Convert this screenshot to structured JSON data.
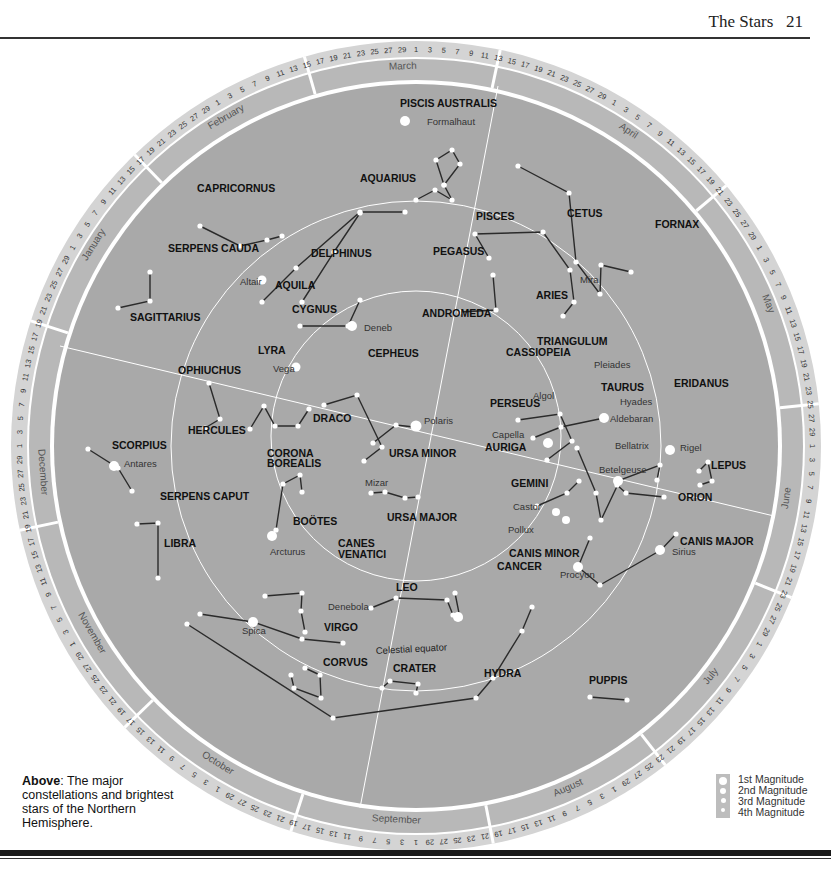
{
  "header": {
    "title": "The Stars",
    "page_number": "21"
  },
  "caption": {
    "lead": "Above",
    "text": ": The major constellations and brightest stars of the Northern Hemisphere."
  },
  "legend": {
    "items": [
      "1st Magnitude",
      "2nd Magnitude",
      "3rd Magnitude",
      "4th Magnitude"
    ]
  },
  "chart": {
    "center": [
      416,
      446
    ],
    "radii": {
      "outer_ring": 405,
      "month_band": 385,
      "disc": 362,
      "equator": 245,
      "inner": 145
    },
    "colors": {
      "disc": "#a9a9a9",
      "band": "#b8b8b8",
      "ring": "#d4d4d4",
      "line": "#2b2b2b",
      "star": "#ffffff",
      "grid": "#ffffff"
    },
    "months": [
      {
        "name": "March",
        "angle": -92
      },
      {
        "name": "February",
        "angle": -120
      },
      {
        "name": "January",
        "angle": -148
      },
      {
        "name": "December",
        "angle": 176
      },
      {
        "name": "November",
        "angle": 150
      },
      {
        "name": "October",
        "angle": 122
      },
      {
        "name": "September",
        "angle": 93
      },
      {
        "name": "August",
        "angle": 66
      },
      {
        "name": "July",
        "angle": 38
      },
      {
        "name": "June",
        "angle": 8
      },
      {
        "name": "May",
        "angle": -22
      },
      {
        "name": "April",
        "angle": -56
      }
    ],
    "month_dividers": [
      -78,
      -106,
      -134,
      -162,
      168,
      136,
      108,
      79,
      52,
      22,
      -6,
      -40
    ],
    "constellations": [
      {
        "name": "PISCIS AUSTRALIS",
        "label_xy": [
          400,
          107
        ]
      },
      {
        "name": "CAPRICORNUS",
        "label_xy": [
          197,
          192
        ]
      },
      {
        "name": "AQUARIUS",
        "label_xy": [
          360,
          182
        ]
      },
      {
        "name": "PISCES",
        "label_xy": [
          476,
          220
        ]
      },
      {
        "name": "CETUS",
        "label_xy": [
          567,
          217
        ]
      },
      {
        "name": "FORNAX",
        "label_xy": [
          655,
          228
        ]
      },
      {
        "name": "SERPENS CAUDA",
        "label_xy": [
          168,
          252
        ]
      },
      {
        "name": "DELPHINUS",
        "label_xy": [
          311,
          257
        ]
      },
      {
        "name": "PEGASUS",
        "label_xy": [
          433,
          255
        ]
      },
      {
        "name": "AQUILA",
        "label_xy": [
          275,
          289
        ]
      },
      {
        "name": "ARIES",
        "label_xy": [
          536,
          299
        ]
      },
      {
        "name": "SAGITTARIUS",
        "label_xy": [
          130,
          321
        ]
      },
      {
        "name": "CYGNUS",
        "label_xy": [
          292,
          313
        ]
      },
      {
        "name": "ANDROMEDA",
        "label_xy": [
          422,
          317
        ]
      },
      {
        "name": "TRIANGULUM",
        "label_xy": [
          537,
          345
        ]
      },
      {
        "name": "LYRA",
        "label_xy": [
          258,
          354
        ]
      },
      {
        "name": "CEPHEUS",
        "label_xy": [
          368,
          357
        ]
      },
      {
        "name": "CASSIOPEIA",
        "label_xy": [
          506,
          356
        ]
      },
      {
        "name": "OPHIUCHUS",
        "label_xy": [
          178,
          374
        ]
      },
      {
        "name": "ERIDANUS",
        "label_xy": [
          674,
          387
        ]
      },
      {
        "name": "TAURUS",
        "label_xy": [
          601,
          391
        ]
      },
      {
        "name": "PERSEUS",
        "label_xy": [
          490,
          407
        ]
      },
      {
        "name": "DRACO",
        "label_xy": [
          313,
          422
        ]
      },
      {
        "name": "HERCULES",
        "label_xy": [
          188,
          434
        ]
      },
      {
        "name": "URSA MINOR",
        "label_xy": [
          389,
          457
        ]
      },
      {
        "name": "AURIGA",
        "label_xy": [
          485,
          451
        ]
      },
      {
        "name": "SCORPIUS",
        "label_xy": [
          112,
          449
        ]
      },
      {
        "name": "CORONA",
        "label_xy": [
          267,
          457
        ]
      },
      {
        "name": "BOREALIS",
        "label_xy": [
          267,
          467
        ]
      },
      {
        "name": "LEPUS",
        "label_xy": [
          711,
          469
        ]
      },
      {
        "name": "GEMINI",
        "label_xy": [
          511,
          487
        ]
      },
      {
        "name": "SERPENS CAPUT",
        "label_xy": [
          160,
          500
        ]
      },
      {
        "name": "ORION",
        "label_xy": [
          678,
          501
        ]
      },
      {
        "name": "BOÖTES",
        "label_xy": [
          293,
          525
        ]
      },
      {
        "name": "URSA MAJOR",
        "label_xy": [
          387,
          521
        ]
      },
      {
        "name": "CANIS MAJOR",
        "label_xy": [
          680,
          545
        ]
      },
      {
        "name": "LIBRA",
        "label_xy": [
          164,
          547
        ]
      },
      {
        "name": "CANES",
        "label_xy": [
          338,
          547
        ]
      },
      {
        "name": "VENATICI",
        "label_xy": [
          338,
          558
        ]
      },
      {
        "name": "CANIS MINOR",
        "label_xy": [
          509,
          557
        ]
      },
      {
        "name": "CANCER",
        "label_xy": [
          497,
          570
        ]
      },
      {
        "name": "LEO",
        "label_xy": [
          396,
          591
        ]
      },
      {
        "name": "VIRGO",
        "label_xy": [
          324,
          631
        ]
      },
      {
        "name": "CORVUS",
        "label_xy": [
          323,
          666
        ]
      },
      {
        "name": "CRATER",
        "label_xy": [
          393,
          672
        ]
      },
      {
        "name": "HYDRA",
        "label_xy": [
          484,
          677
        ]
      },
      {
        "name": "PUPPIS",
        "label_xy": [
          589,
          684
        ]
      }
    ],
    "stars": [
      {
        "name": "Formalhaut",
        "label_xy": [
          427,
          125
        ]
      },
      {
        "name": "Altair",
        "label_xy": [
          240,
          285
        ]
      },
      {
        "name": "Mira",
        "label_xy": [
          580,
          283
        ]
      },
      {
        "name": "Deneb",
        "label_xy": [
          364,
          331
        ]
      },
      {
        "name": "Vega",
        "label_xy": [
          273,
          372
        ]
      },
      {
        "name": "Pleiades",
        "label_xy": [
          594,
          368
        ]
      },
      {
        "name": "Algol",
        "label_xy": [
          533,
          399
        ]
      },
      {
        "name": "Hyades",
        "label_xy": [
          620,
          405
        ]
      },
      {
        "name": "Aldebaran",
        "label_xy": [
          610,
          422
        ]
      },
      {
        "name": "Polaris",
        "label_xy": [
          424,
          424
        ]
      },
      {
        "name": "Antares",
        "label_xy": [
          124,
          467
        ]
      },
      {
        "name": "Capella",
        "label_xy": [
          492,
          438
        ]
      },
      {
        "name": "Bellatrix",
        "label_xy": [
          615,
          449
        ]
      },
      {
        "name": "Rigel",
        "label_xy": [
          680,
          451
        ]
      },
      {
        "name": "Betelgeuse",
        "label_xy": [
          599,
          473
        ]
      },
      {
        "name": "Mizar",
        "label_xy": [
          365,
          486
        ]
      },
      {
        "name": "Castor",
        "label_xy": [
          513,
          510
        ]
      },
      {
        "name": "Pollux",
        "label_xy": [
          508,
          533
        ]
      },
      {
        "name": "Arcturus",
        "label_xy": [
          270,
          555
        ]
      },
      {
        "name": "Sirius",
        "label_xy": [
          672,
          555
        ]
      },
      {
        "name": "Procyon",
        "label_xy": [
          560,
          578
        ]
      },
      {
        "name": "Denebola",
        "label_xy": [
          328,
          610
        ]
      },
      {
        "name": "Spica",
        "label_xy": [
          242,
          634
        ]
      }
    ],
    "annotations": [
      {
        "text": "Celestial equator",
        "label_xy": [
          376,
          654
        ]
      }
    ]
  }
}
